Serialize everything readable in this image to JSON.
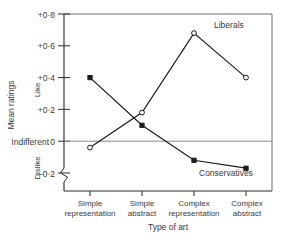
{
  "chart_data": {
    "type": "line",
    "title": "",
    "xlabel": "Type of art",
    "ylabel": "Mean ratings",
    "categories": [
      "Simple representation",
      "Simple abstract",
      "Complex representation",
      "Complex abstract"
    ],
    "categories_line1": [
      "Simple",
      "Simple",
      "Complex",
      "Complex"
    ],
    "categories_line2": [
      "representation",
      "abstract",
      "representation",
      "abstract"
    ],
    "ylim": [
      -0.2,
      0.8
    ],
    "yticks": [
      -0.2,
      0,
      0.2,
      0.4,
      0.6,
      0.8
    ],
    "ytick_labels": [
      "–0·2",
      "0",
      "+0·2",
      "+0·4",
      "+0·6",
      "+0·8"
    ],
    "y_zero_label": "Indifferent",
    "y_positive_label": "Like",
    "y_negative_label": "Dislike",
    "grid": false,
    "legend_position": "inline-annotation",
    "axis_break": true,
    "series": [
      {
        "name": "Liberals",
        "marker": "open-circle",
        "values": [
          -0.04,
          0.18,
          0.68,
          0.4
        ]
      },
      {
        "name": "Conservatives",
        "marker": "filled-square",
        "values": [
          0.4,
          0.1,
          -0.12,
          -0.17
        ]
      }
    ],
    "annotations": [
      {
        "text": "Liberals",
        "x": 3.05,
        "y": 0.72
      },
      {
        "text": "Conservatives",
        "x": 2.95,
        "y": -0.22
      }
    ]
  }
}
